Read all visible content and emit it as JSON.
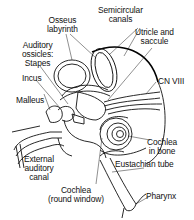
{
  "diagram": {
    "labels": {
      "osseus_labyrinth": [
        "Osseus",
        "labyrinth"
      ],
      "semicircular_canals": [
        "Semicircular",
        "canals"
      ],
      "auditory_ossicles": [
        "Auditory",
        "ossicles:",
        "Stapes"
      ],
      "utricle_saccule": [
        "Utricle and",
        "saccule"
      ],
      "incus": [
        "Incus"
      ],
      "malleus": [
        "Malleus"
      ],
      "cn_viii": [
        "CN VIII"
      ],
      "cochlea_in_bone": [
        "Cochlea",
        "in bone"
      ],
      "external_auditory_canal": [
        "External",
        "auditory",
        "canal"
      ],
      "eustachian_tube": [
        "Eustachian tube"
      ],
      "cochlea_round_window": [
        "Cochlea",
        "(round window)"
      ],
      "pharynx": [
        "Pharynx"
      ]
    },
    "colors": {
      "line": "#111111",
      "background": "#ffffff"
    }
  }
}
